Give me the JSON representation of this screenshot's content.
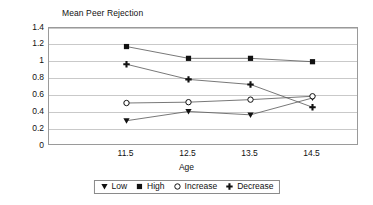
{
  "chart_data": {
    "type": "line",
    "title": "Mean Peer Rejection",
    "xlabel": "Age",
    "ylabel": "",
    "categories": [
      "11.5",
      "12.5",
      "13.5",
      "14.5"
    ],
    "x": [
      11.5,
      12.5,
      13.5,
      14.5
    ],
    "ylim": [
      0,
      1.4
    ],
    "ytick_labels": [
      "0",
      "0.2",
      "0.4",
      "0.6",
      "0.8",
      "1",
      "1.2",
      "1.4"
    ],
    "ytick_values": [
      0,
      0.2,
      0.4,
      0.6,
      0.8,
      1.0,
      1.2,
      1.4
    ],
    "grid": "horizontal",
    "legend_position": "bottom",
    "series": [
      {
        "name": "Low",
        "marker": "triangle-down",
        "filled": true,
        "values": [
          0.3,
          0.41,
          0.37,
          0.57
        ]
      },
      {
        "name": "High",
        "marker": "square",
        "filled": true,
        "values": [
          1.18,
          1.04,
          1.04,
          1.0
        ]
      },
      {
        "name": "Increase",
        "marker": "circle-open",
        "filled": false,
        "values": [
          0.51,
          0.52,
          0.55,
          0.59
        ]
      },
      {
        "name": "Decrease",
        "marker": "plus",
        "filled": true,
        "values": [
          0.97,
          0.79,
          0.73,
          0.46
        ]
      }
    ],
    "colors": {
      "line": "#555555",
      "marker": "#111111",
      "grid": "#c9c9c9",
      "axis": "#9a9a9a",
      "background": "#ffffff"
    }
  }
}
